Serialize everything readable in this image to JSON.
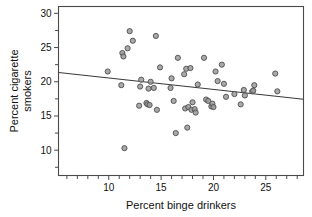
{
  "chart_data": {
    "type": "scatter",
    "title": "",
    "xlabel": "Percent binge drinkers",
    "ylabel": "Percent cigarette smokers",
    "ylabel_line1": "Percent cigarette",
    "ylabel_line2": "smokers",
    "xlim": [
      5.2,
      28.6
    ],
    "ylim": [
      6.3,
      31.0
    ],
    "xticks": [
      10,
      15,
      20,
      25
    ],
    "xtick_labels": [
      "10",
      "15",
      "20",
      "25"
    ],
    "xticks_minor": [
      6,
      7,
      8,
      9,
      11,
      12,
      13,
      14,
      16,
      17,
      18,
      19,
      21,
      22,
      23,
      24,
      26,
      27,
      28
    ],
    "yticks": [
      10,
      15,
      20,
      25,
      30
    ],
    "ytick_labels": [
      "10",
      "15",
      "20",
      "25",
      "30"
    ],
    "yticks_minor": [
      7.5,
      12.5,
      17.5,
      22.5,
      27.5
    ],
    "grid": false,
    "legend": null,
    "marker": {
      "shape": "circle",
      "size_px": 5.2,
      "fill_color": "#9a9a9a",
      "edge_color": "#4d4d4d"
    },
    "trendline": {
      "type": "linear-fit",
      "color": "#3a3a3a",
      "x_start": 5.2,
      "y_start": 21.35,
      "x_end": 28.6,
      "y_end": 17.45,
      "slope": -0.1667,
      "intercept": 22.22
    },
    "points": [
      {
        "x": 9.9,
        "y": 21.5
      },
      {
        "x": 11.2,
        "y": 19.5
      },
      {
        "x": 11.3,
        "y": 24.2
      },
      {
        "x": 11.4,
        "y": 23.7
      },
      {
        "x": 11.5,
        "y": 10.3
      },
      {
        "x": 11.8,
        "y": 24.9
      },
      {
        "x": 12.0,
        "y": 27.4
      },
      {
        "x": 12.3,
        "y": 26.0
      },
      {
        "x": 12.9,
        "y": 16.5
      },
      {
        "x": 13.0,
        "y": 19.3
      },
      {
        "x": 13.1,
        "y": 20.3
      },
      {
        "x": 13.6,
        "y": 16.9
      },
      {
        "x": 13.7,
        "y": 16.7
      },
      {
        "x": 13.8,
        "y": 19.0
      },
      {
        "x": 13.9,
        "y": 16.6
      },
      {
        "x": 14.0,
        "y": 20.0
      },
      {
        "x": 14.3,
        "y": 19.1
      },
      {
        "x": 14.5,
        "y": 26.7
      },
      {
        "x": 14.6,
        "y": 15.9
      },
      {
        "x": 14.9,
        "y": 22.1
      },
      {
        "x": 15.9,
        "y": 19.1
      },
      {
        "x": 16.0,
        "y": 20.5
      },
      {
        "x": 16.2,
        "y": 17.2
      },
      {
        "x": 16.4,
        "y": 12.5
      },
      {
        "x": 16.6,
        "y": 23.5
      },
      {
        "x": 17.2,
        "y": 21.1
      },
      {
        "x": 17.3,
        "y": 16.1
      },
      {
        "x": 17.4,
        "y": 21.9
      },
      {
        "x": 17.5,
        "y": 13.3
      },
      {
        "x": 17.6,
        "y": 16.3
      },
      {
        "x": 17.8,
        "y": 22.0
      },
      {
        "x": 17.9,
        "y": 15.9
      },
      {
        "x": 18.0,
        "y": 17.0
      },
      {
        "x": 18.2,
        "y": 16.0
      },
      {
        "x": 18.3,
        "y": 15.5
      },
      {
        "x": 18.5,
        "y": 19.6
      },
      {
        "x": 19.1,
        "y": 23.5
      },
      {
        "x": 19.3,
        "y": 17.4
      },
      {
        "x": 19.5,
        "y": 17.2
      },
      {
        "x": 19.8,
        "y": 16.4
      },
      {
        "x": 19.9,
        "y": 16.8
      },
      {
        "x": 20.0,
        "y": 16.3
      },
      {
        "x": 20.2,
        "y": 21.5
      },
      {
        "x": 20.4,
        "y": 20.1
      },
      {
        "x": 20.8,
        "y": 22.5
      },
      {
        "x": 21.0,
        "y": 19.7
      },
      {
        "x": 21.2,
        "y": 17.8
      },
      {
        "x": 22.0,
        "y": 18.2
      },
      {
        "x": 22.6,
        "y": 16.7
      },
      {
        "x": 22.9,
        "y": 18.8
      },
      {
        "x": 23.0,
        "y": 18.0
      },
      {
        "x": 23.7,
        "y": 18.6
      },
      {
        "x": 23.8,
        "y": 18.7
      },
      {
        "x": 23.9,
        "y": 19.5
      },
      {
        "x": 25.9,
        "y": 21.2
      },
      {
        "x": 26.1,
        "y": 18.6
      }
    ]
  }
}
